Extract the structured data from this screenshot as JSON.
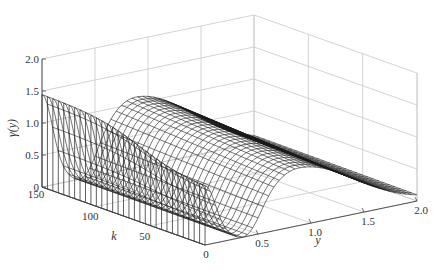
{
  "chart_data": {
    "type": "surface",
    "title": "",
    "zlabel": "γ(y)",
    "xlabel": "k",
    "ylabel": "y",
    "axes": {
      "k": {
        "range": [
          0,
          150
        ],
        "ticks": [
          0,
          50,
          100,
          150
        ],
        "tick_labels": [
          "0",
          "50",
          "100",
          "150"
        ]
      },
      "y": {
        "range": [
          0,
          2.0
        ],
        "ticks": [
          0.5,
          1.0,
          1.5,
          2.0
        ],
        "tick_labels": [
          "0.5",
          "1.0",
          "1.5",
          "2.0"
        ]
      },
      "z": {
        "range": [
          0,
          2.0
        ],
        "ticks": [
          0,
          0.5,
          1.0,
          1.5,
          2.0
        ],
        "tick_labels": [
          "0",
          "0.5",
          "1.0",
          "1.5",
          "2.0"
        ]
      }
    },
    "grid": true,
    "style": "wireframe mesh, black lines on white",
    "sample_profile_k150": {
      "y": [
        0,
        0.1,
        0.35,
        0.6,
        0.85,
        1.2,
        1.6,
        2.0
      ],
      "z": [
        1.45,
        1.4,
        0.05,
        0.7,
        1.1,
        0.75,
        0.3,
        0.08
      ]
    },
    "sample_profile_k0": {
      "y": [
        0,
        0.1,
        0.35,
        0.6,
        0.85,
        1.2,
        1.6,
        2.0
      ],
      "z": [
        0.9,
        0.85,
        0.0,
        0.55,
        0.9,
        0.6,
        0.25,
        0.05
      ]
    }
  },
  "colors": {
    "mesh": "#1a1a1a",
    "grid": "#c8c8c8",
    "axis": "#444444",
    "background": "#ffffff"
  }
}
